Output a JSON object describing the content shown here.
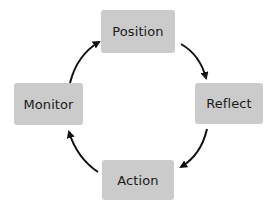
{
  "diagram": {
    "type": "cycle",
    "nodes": [
      {
        "id": "position",
        "label": "Position"
      },
      {
        "id": "reflect",
        "label": "Reflect"
      },
      {
        "id": "action",
        "label": "Action"
      },
      {
        "id": "monitor",
        "label": "Monitor"
      }
    ],
    "edges": [
      {
        "from": "position",
        "to": "reflect"
      },
      {
        "from": "reflect",
        "to": "action"
      },
      {
        "from": "action",
        "to": "monitor"
      },
      {
        "from": "monitor",
        "to": "position"
      }
    ],
    "colors": {
      "node_fill": "#cbcbcb",
      "text": "#1a1a1a",
      "arrow": "#111111",
      "background": "#ffffff"
    }
  }
}
